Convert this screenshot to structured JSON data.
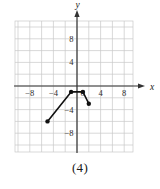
{
  "figure": {
    "caption": "(4)",
    "axis_x_label": "x",
    "axis_y_label": "y"
  },
  "chart_data": {
    "type": "line",
    "title": "",
    "xlabel": "x",
    "ylabel": "y",
    "xlim": [
      -10,
      10
    ],
    "ylim": [
      -10,
      10
    ],
    "grid": true,
    "legend": null,
    "grid_step": 2,
    "x_tick_labels": [
      "-8",
      "-4",
      "0",
      "4",
      "8"
    ],
    "x_tick_values": [
      -8,
      -4,
      0,
      4,
      8
    ],
    "y_tick_labels": [
      "8",
      "4",
      "-4",
      "-8"
    ],
    "y_tick_values": [
      8,
      4,
      -4,
      -8
    ],
    "series": [
      {
        "name": "piecewise-path",
        "markers": true,
        "points": [
          {
            "x": -5,
            "y": -6
          },
          {
            "x": -1,
            "y": -1
          },
          {
            "x": 1,
            "y": -1
          },
          {
            "x": 2,
            "y": -3
          }
        ]
      }
    ]
  }
}
